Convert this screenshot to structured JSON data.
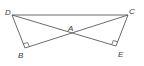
{
  "diagram": {
    "type": "geometry",
    "points": {
      "D": {
        "label": "D",
        "x": 12,
        "y": 15,
        "lx": 5,
        "ly": 15
      },
      "C": {
        "label": "C",
        "x": 128,
        "y": 15,
        "lx": 129,
        "ly": 14
      },
      "B": {
        "label": "B",
        "x": 25,
        "y": 48,
        "lx": 18,
        "ly": 58
      },
      "E": {
        "label": "E",
        "x": 116,
        "y": 46,
        "lx": 118,
        "ly": 57
      },
      "A": {
        "label": "A",
        "x": 71,
        "y": 33,
        "lx": 68,
        "ly": 31
      }
    },
    "segments": [
      [
        "D",
        "C"
      ],
      [
        "D",
        "B"
      ],
      [
        "D",
        "E"
      ],
      [
        "B",
        "C"
      ],
      [
        "C",
        "E"
      ]
    ],
    "right_angles": [
      "B",
      "E"
    ],
    "stroke_color": "#5a5a5a",
    "label_color": "#3a3a3a"
  }
}
